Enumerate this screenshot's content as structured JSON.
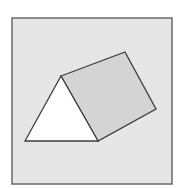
{
  "diagram": {
    "colors": {
      "page_background": "#ffffff",
      "frame_fill": "#e6e6e6",
      "frame_stroke": "#6a6a6a",
      "triangle_fill": "#ffffff",
      "square_fill": "#d4d4d4",
      "shape_stroke": "#3c3c3c"
    },
    "frame": {
      "x": 12,
      "y": 18,
      "width": 160,
      "height": 166
    },
    "triangle": {
      "points": [
        [
          61,
          76
        ],
        [
          25,
          141
        ],
        [
          98,
          141
        ]
      ]
    },
    "square": {
      "points": [
        [
          61,
          76
        ],
        [
          125,
          52
        ],
        [
          156,
          109
        ],
        [
          98,
          141
        ]
      ]
    }
  }
}
